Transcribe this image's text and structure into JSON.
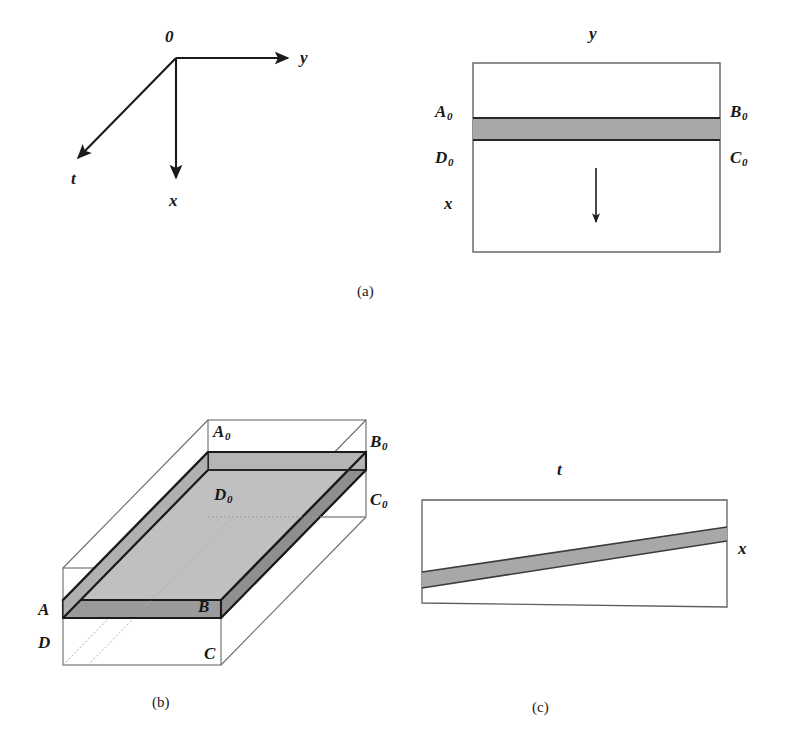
{
  "figure": {
    "background_color": "#ffffff",
    "line_color": "#1a1a1a",
    "band_fill_color": "#a8a8a8",
    "slab_top_fill_color": "#b9b9b9",
    "slab_side_fill_color": "#8f8f8f",
    "thin_line_color": "#6b6b6b"
  },
  "panel_a_axes": {
    "origin_label": "0",
    "y_axis_label": "y",
    "x_axis_label": "x",
    "t_axis_label": "t"
  },
  "panel_a_rect": {
    "top_label": "y",
    "left_label": "x",
    "corner_top_left": "A",
    "corner_top_left_sub": "0",
    "corner_top_right": "B",
    "corner_top_right_sub": "0",
    "corner_bottom_left": "D",
    "corner_bottom_left_sub": "0",
    "corner_bottom_right": "C",
    "corner_bottom_right_sub": "0",
    "arrow_direction": "down"
  },
  "panel_b_box": {
    "back_top_left": "A",
    "back_top_left_sub": "0",
    "back_top_right": "B",
    "back_top_right_sub": "0",
    "back_bottom_left": "D",
    "back_bottom_left_sub": "0",
    "back_bottom_right": "C",
    "back_bottom_right_sub": "0",
    "front_top_left": "A",
    "front_top_right": "B",
    "front_bottom_left": "D",
    "front_bottom_right": "C"
  },
  "panel_c_rect": {
    "top_label": "t",
    "right_label": "x"
  },
  "captions": {
    "a": "(a)",
    "b": "(b)",
    "c": "(c)"
  }
}
